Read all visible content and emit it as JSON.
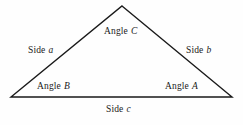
{
  "figure": {
    "background_color": "#fefefe",
    "stroke_color": "#1a1a1a",
    "text_color": "#1a1a1a"
  },
  "triangle": {
    "vertices": {
      "apex": {
        "x": 122,
        "y": 6
      },
      "bottom_left": {
        "x": 11,
        "y": 97
      },
      "bottom_right": {
        "x": 232,
        "y": 97
      }
    },
    "stroke_width": 1.4
  },
  "labels": {
    "angle_c": {
      "word": "Angle",
      "symbol": "C"
    },
    "angle_b": {
      "word": "Angle",
      "symbol": "B"
    },
    "angle_a": {
      "word": "Angle",
      "symbol": "A"
    },
    "side_a": {
      "word": "Side",
      "symbol": "a"
    },
    "side_b": {
      "word": "Side",
      "symbol": "b"
    },
    "side_c": {
      "word": "Side",
      "symbol": "c"
    }
  }
}
